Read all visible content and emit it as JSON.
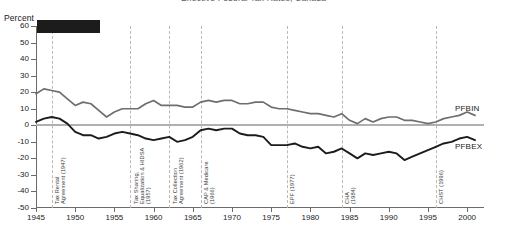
{
  "title": "Effective Federal Tax Rates, Canada",
  "axis_title": "Percent",
  "redaction_note": "black-bar",
  "chart_data": {
    "type": "line",
    "title": "Effective Federal Tax Rates, Canada",
    "xlabel": "",
    "ylabel": "Percent",
    "ylim": [
      -50,
      60
    ],
    "xlim": [
      1945,
      2001
    ],
    "grid": "vertical-dashed-event-lines",
    "legend_position": "right-inline",
    "ytick_labels": [
      "60",
      "50",
      "40",
      "30",
      "20",
      "10",
      "0",
      "-10",
      "-20",
      "-30",
      "-40",
      "-50"
    ],
    "ytick_values": [
      60,
      50,
      40,
      30,
      20,
      10,
      0,
      -10,
      -20,
      -30,
      -40,
      -50
    ],
    "xtick_labels": [
      "1945",
      "1950",
      "1955",
      "1960",
      "1965",
      "1970",
      "1975",
      "1980",
      "1985",
      "1990",
      "1995",
      "2000"
    ],
    "xtick_values": [
      1945,
      1950,
      1955,
      1960,
      1965,
      1970,
      1975,
      1980,
      1985,
      1990,
      1995,
      2000
    ],
    "x": [
      1945,
      1946,
      1947,
      1948,
      1949,
      1950,
      1951,
      1952,
      1953,
      1954,
      1955,
      1956,
      1957,
      1958,
      1959,
      1960,
      1961,
      1962,
      1963,
      1964,
      1965,
      1966,
      1967,
      1968,
      1969,
      1970,
      1971,
      1972,
      1973,
      1974,
      1975,
      1976,
      1977,
      1978,
      1979,
      1980,
      1981,
      1982,
      1983,
      1984,
      1985,
      1986,
      1987,
      1988,
      1989,
      1990,
      1991,
      1992,
      1993,
      1994,
      1995,
      1996,
      1997,
      1998,
      1999,
      2000,
      2001
    ],
    "series": [
      {
        "name": "PFBIN",
        "color": "#6e6e6e",
        "label_text": "PFBIN",
        "values": [
          19,
          22,
          21,
          20,
          16,
          12,
          14,
          13,
          9,
          5,
          8,
          10,
          10,
          10,
          13,
          15,
          12,
          12,
          12,
          11,
          11,
          14,
          15,
          14,
          15,
          15,
          13,
          13,
          14,
          14,
          11,
          10,
          10,
          9,
          8,
          7,
          7,
          6,
          5,
          7,
          3,
          1,
          4,
          2,
          4,
          5,
          5,
          3,
          3,
          2,
          1,
          2,
          4,
          5,
          6,
          8,
          6
        ]
      },
      {
        "name": "PFBEX",
        "color": "#1c1c1c",
        "label_text": "PFBEX",
        "values": [
          2,
          4,
          5,
          4,
          1,
          -4,
          -6,
          -6,
          -8,
          -7,
          -5,
          -4,
          -5,
          -6,
          -8,
          -9,
          -8,
          -7,
          -10,
          -9,
          -7,
          -3,
          -2,
          -3,
          -2,
          -2,
          -5,
          -6,
          -6,
          -7,
          -12,
          -12,
          -12,
          -11,
          -13,
          -14,
          -13,
          -17,
          -16,
          -14,
          -17,
          -20,
          -17,
          -18,
          -17,
          -16,
          -17,
          -21,
          -19,
          -17,
          -15,
          -13,
          -11,
          -10,
          -8,
          -7,
          -9
        ]
      }
    ],
    "annotations": [
      {
        "year": 1947,
        "label": [
          "Tax Rental",
          "Agreement (1947)"
        ]
      },
      {
        "year": 1957,
        "label": [
          "Tax Sharing,",
          "Equalization & HIDSA",
          "(1957)"
        ]
      },
      {
        "year": 1962,
        "label": [
          "Tax Collection",
          "Agreement (1962)"
        ]
      },
      {
        "year": 1966,
        "label": [
          "CAP & Medicare",
          "(1966)"
        ]
      },
      {
        "year": 1977,
        "label": [
          "EPF (1977)"
        ]
      },
      {
        "year": 1984,
        "label": [
          "CHA",
          "(1984)"
        ]
      },
      {
        "year": 1996,
        "label": [
          "CHST (1996)"
        ]
      }
    ]
  },
  "colors": {
    "pfbin": "#6e6e6e",
    "pfbex": "#1c1c1c",
    "zero_line": "#b0b0b0",
    "event_rule": "#b9b9b9",
    "axis": "#6b6b6b",
    "redaction": "#1c1c1c"
  }
}
